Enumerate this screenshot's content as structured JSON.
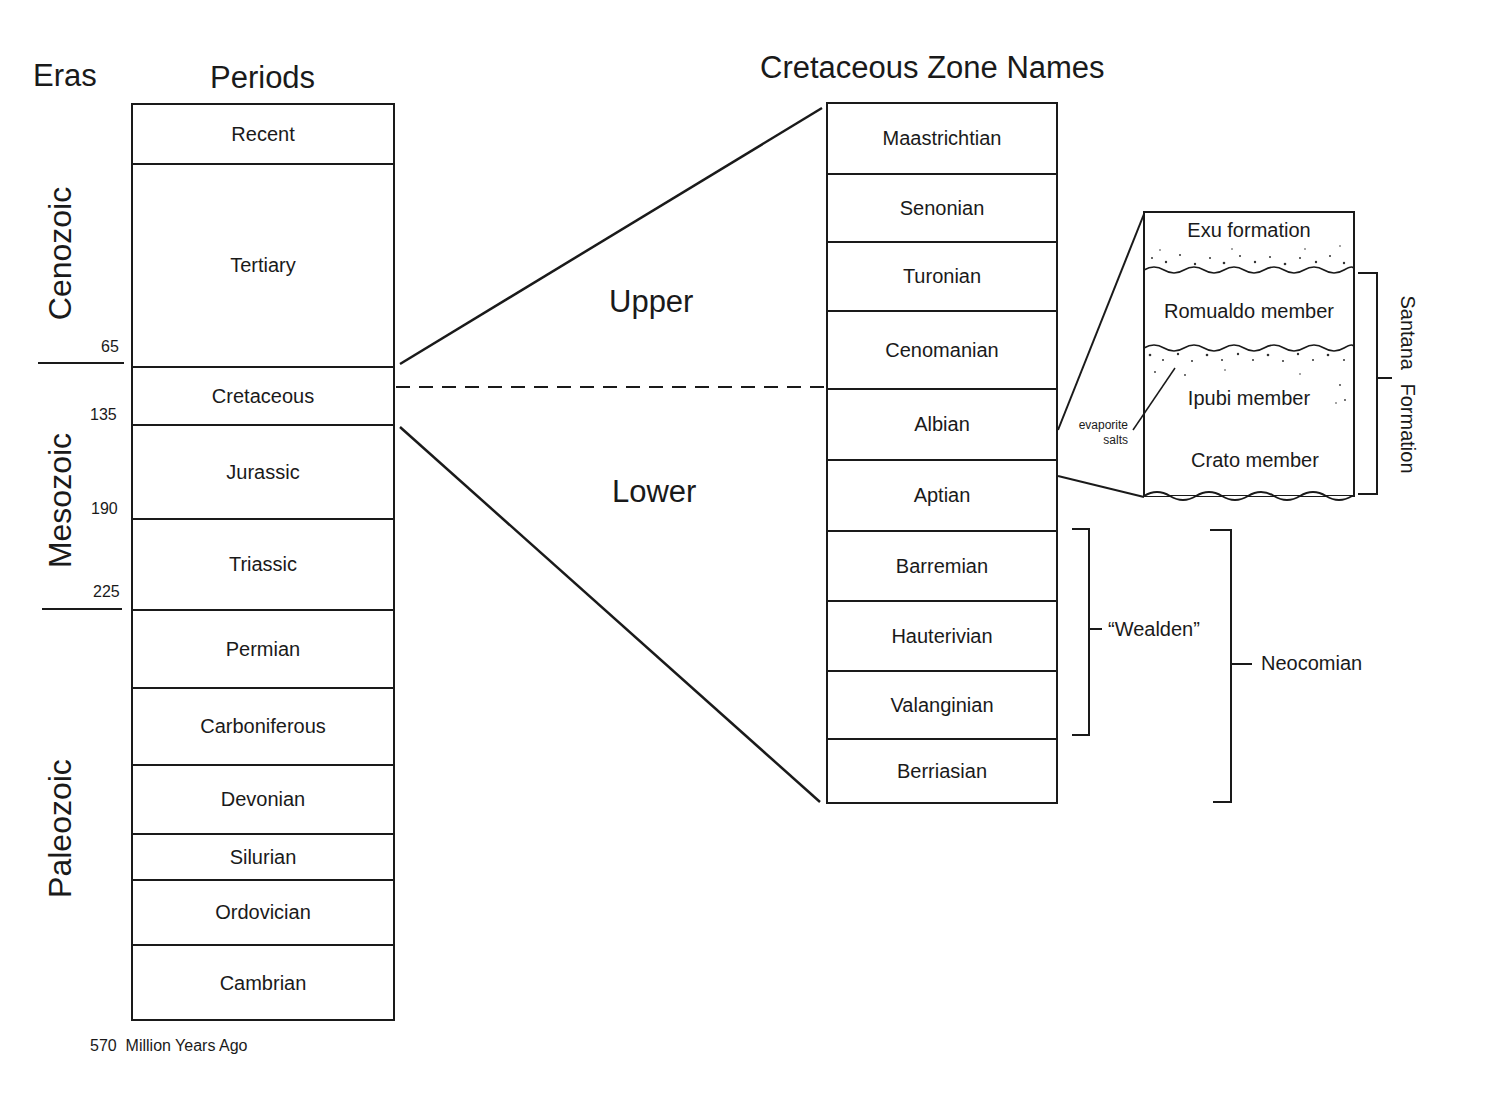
{
  "headers": {
    "eras": "Eras",
    "periods": "Periods",
    "zones": "Cretaceous Zone Names"
  },
  "eras": [
    {
      "name": "Cenozoic"
    },
    {
      "name": "Mesozoic"
    },
    {
      "name": "Paleozoic"
    }
  ],
  "ages": [
    "65",
    "135",
    "190",
    "225"
  ],
  "footer": {
    "age": "570",
    "label": "Million Years Ago"
  },
  "periods": [
    "Recent",
    "Tertiary",
    "Cretaceous",
    "Jurassic",
    "Triassic",
    "Permian",
    "Carboniferous",
    "Devonian",
    "Silurian",
    "Ordovician",
    "Cambrian"
  ],
  "subdivisions": {
    "upper": "Upper",
    "lower": "Lower"
  },
  "zones": [
    "Maastrichtian",
    "Senonian",
    "Turonian",
    "Cenomanian",
    "Albian",
    "Aptian",
    "Barremian",
    "Hauterivian",
    "Valanginian",
    "Berriasian"
  ],
  "groupings": {
    "wealden": "“Wealden”",
    "neocomian": "Neocomian"
  },
  "santana": {
    "units": [
      "Exu formation",
      "Romualdo member",
      "Ipubi member",
      "Crato member"
    ],
    "bracket_label": "Santana Formation",
    "annotation_line1": "evaporite",
    "annotation_line2": "salts"
  }
}
